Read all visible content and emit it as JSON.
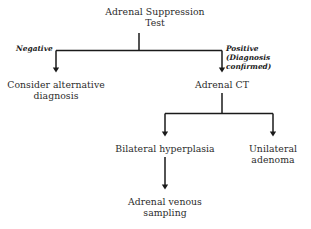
{
  "diagram": {
    "title": "Adrenal Suppression Test",
    "type": "flowchart",
    "orientation": "top-down",
    "colors": {
      "background": "#ffffff",
      "text": "#2b2b2b",
      "label_text": "#1a1a1a",
      "connector": "#1a1a1a"
    },
    "nodes": {
      "root": "Adrenal Suppression\nTest",
      "negative_outcome": "Consider alternative\ndiagnosis",
      "positive_outcome": "Adrenal CT",
      "bilateral": "Bilateral hyperplasia",
      "unilateral": "Unilateral\nadenoma",
      "venous_sampling": "Adrenal venous\nsampling"
    },
    "edge_labels": {
      "negative": "Negative",
      "positive": "Positive\n(Diagnosis confirmed)"
    }
  }
}
